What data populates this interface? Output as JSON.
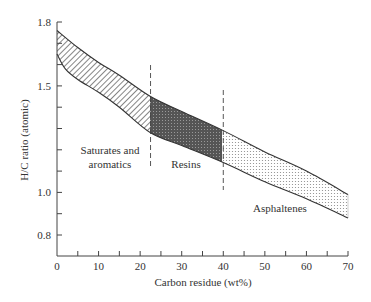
{
  "chart_data": {
    "type": "area",
    "title": "",
    "xlabel": "Carbon residue (wt%)",
    "ylabel": "H/C ratio (atomic)",
    "xlim": [
      0,
      70
    ],
    "ylim": [
      0.7,
      1.8
    ],
    "x_ticks": [
      0,
      10,
      20,
      30,
      40,
      50,
      60,
      70
    ],
    "y_ticks": [
      0.8,
      1.0,
      1.5,
      1.8
    ],
    "grid": false,
    "band": {
      "upper": {
        "x": [
          0,
          5,
          10,
          15,
          22.5,
          30,
          40,
          50,
          60,
          70
        ],
        "y": [
          1.76,
          1.68,
          1.61,
          1.55,
          1.45,
          1.38,
          1.29,
          1.19,
          1.1,
          0.99
        ]
      },
      "lower": {
        "x": [
          0,
          2,
          5,
          10,
          15,
          22.5,
          30,
          40,
          50,
          60,
          70
        ],
        "y": [
          1.65,
          1.58,
          1.53,
          1.47,
          1.4,
          1.28,
          1.22,
          1.14,
          1.05,
          0.97,
          0.88
        ]
      }
    },
    "regions": [
      {
        "name": "Saturates and aromatics",
        "x_range": [
          0,
          22.5
        ],
        "fill": "hatched"
      },
      {
        "name": "Resins",
        "x_range": [
          22.5,
          40
        ],
        "fill": "dark-crosshatch"
      },
      {
        "name": "Asphaltenes",
        "x_range": [
          40,
          70
        ],
        "fill": "dotted"
      }
    ],
    "dividers": [
      22.5,
      40
    ],
    "annotations": [
      "Saturates and",
      "aromatics",
      "Resins",
      "Asphaltenes"
    ]
  }
}
